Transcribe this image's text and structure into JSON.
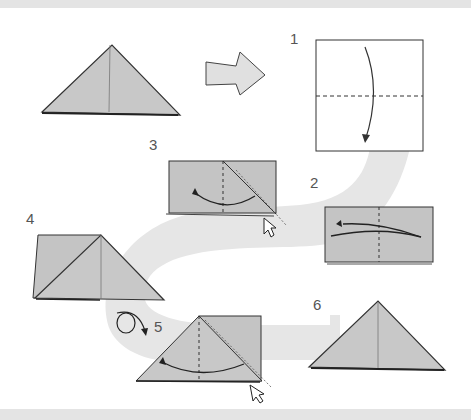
{
  "colors": {
    "paper": "#c4c4c4",
    "paper_light": "#d2d2d2",
    "path": "#e6e6e6",
    "outline": "#333333",
    "band": "#e4e4e4",
    "label": "#555555"
  },
  "steps": [
    {
      "number": "1",
      "description": "Square sheet, fold top half down along horizontal dashed line"
    },
    {
      "number": "2",
      "description": "Rectangle, fold right half over to the left along vertical dashed line"
    },
    {
      "number": "3",
      "description": "Squash fold: open flap and flatten along diagonal"
    },
    {
      "number": "4",
      "description": "Triangle formed on the right with square flap on the left"
    },
    {
      "number": "5",
      "description": "Turn model over"
    },
    {
      "number": "6",
      "description": "Repeat squash fold; finished triangle (preliminary base)"
    }
  ],
  "result_arrow": {
    "icon": "arrow-right-icon",
    "meaning": "result"
  },
  "labels": {
    "s1": "1",
    "s2": "2",
    "s3": "3",
    "s4": "4",
    "s5": "5",
    "s6": "6"
  }
}
